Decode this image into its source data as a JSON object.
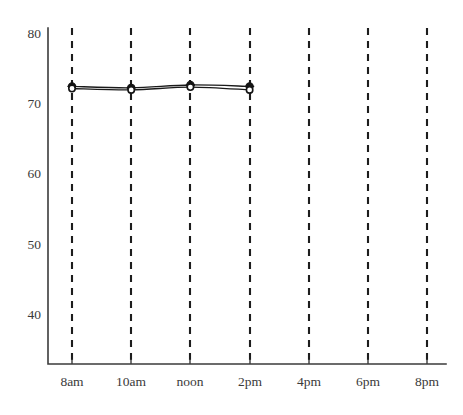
{
  "chart_data": {
    "type": "line",
    "title": "",
    "subtitle": "",
    "xlabel": "",
    "ylabel": "",
    "x_tick_labels": [
      "8am",
      "10am",
      "noon",
      "2pm",
      "4pm",
      "6pm",
      "8pm"
    ],
    "x_tick_values": [
      8,
      10,
      12,
      14,
      16,
      18,
      20
    ],
    "y_tick_labels": [
      "80",
      "70",
      "60",
      "50",
      "40"
    ],
    "y_tick_values": [
      80,
      70,
      60,
      50,
      40
    ],
    "ylim": [
      36,
      80
    ],
    "xlim": [
      7,
      21
    ],
    "grid": "vertical-dashed",
    "legend": "none",
    "series": [
      {
        "name": "observed",
        "marker": "filled-circle",
        "x": [
          8,
          10,
          12,
          14
        ],
        "x_labels": [
          "8am",
          "10am",
          "noon",
          "2pm"
        ],
        "values": [
          72.4,
          72.2,
          72.6,
          72.4
        ]
      },
      {
        "name": "overlay",
        "marker": "open-circle",
        "x": [
          8,
          10,
          12,
          14
        ],
        "x_labels": [
          "8am",
          "10am",
          "noon",
          "2pm"
        ],
        "values": [
          72.1,
          71.9,
          72.3,
          71.9
        ]
      }
    ],
    "annotations": []
  },
  "axes": {
    "y_ticks": [
      {
        "label": "80",
        "value": 80
      },
      {
        "label": "70",
        "value": 70
      },
      {
        "label": "60",
        "value": 60
      },
      {
        "label": "50",
        "value": 50
      },
      {
        "label": "40",
        "value": 40
      }
    ],
    "x_ticks": [
      {
        "label": "8am",
        "value": 8
      },
      {
        "label": "10am",
        "value": 10
      },
      {
        "label": "noon",
        "value": 12
      },
      {
        "label": "2pm",
        "value": 14
      },
      {
        "label": "4pm",
        "value": 16
      },
      {
        "label": "6pm",
        "value": 18
      },
      {
        "label": "8pm",
        "value": 20
      }
    ]
  },
  "colors": {
    "axis": "#3b3b3b",
    "grid": "#1d1d1d",
    "line": "#1a1a1a",
    "marker_fill": "#141414",
    "marker_open_fill": "#ffffff",
    "background": "#ffffff",
    "text": "#3a3a3a"
  }
}
